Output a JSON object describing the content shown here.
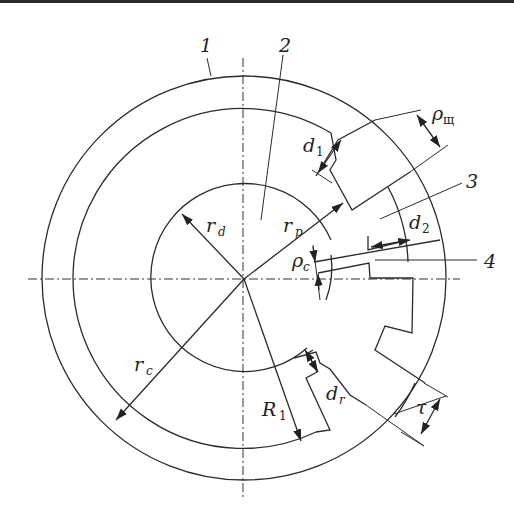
{
  "diagram": {
    "numbered_callouts": [
      {
        "id": "1",
        "text": "1"
      },
      {
        "id": "2",
        "text": "2"
      },
      {
        "id": "3",
        "text": "3"
      },
      {
        "id": "4",
        "text": "4"
      }
    ],
    "dimension_labels": {
      "r_d": {
        "main": "r",
        "sub": "d"
      },
      "r_p": {
        "main": "r",
        "sub": "p"
      },
      "r_c": {
        "main": "r",
        "sub": "c"
      },
      "R_1": {
        "main": "R",
        "sub": "1"
      },
      "d_1": {
        "main": "d",
        "sub": "1"
      },
      "d_2": {
        "main": "d",
        "sub": "2"
      },
      "d_r": {
        "main": "d",
        "sub": "r"
      },
      "rho_c": {
        "main": "ρ",
        "sub": "c"
      },
      "rho_sh": {
        "main": "ρ",
        "sub": "щ"
      },
      "tau": {
        "main": "τ"
      }
    },
    "colors": {
      "line": "#2b2b2b",
      "background": "#ffffff"
    }
  }
}
